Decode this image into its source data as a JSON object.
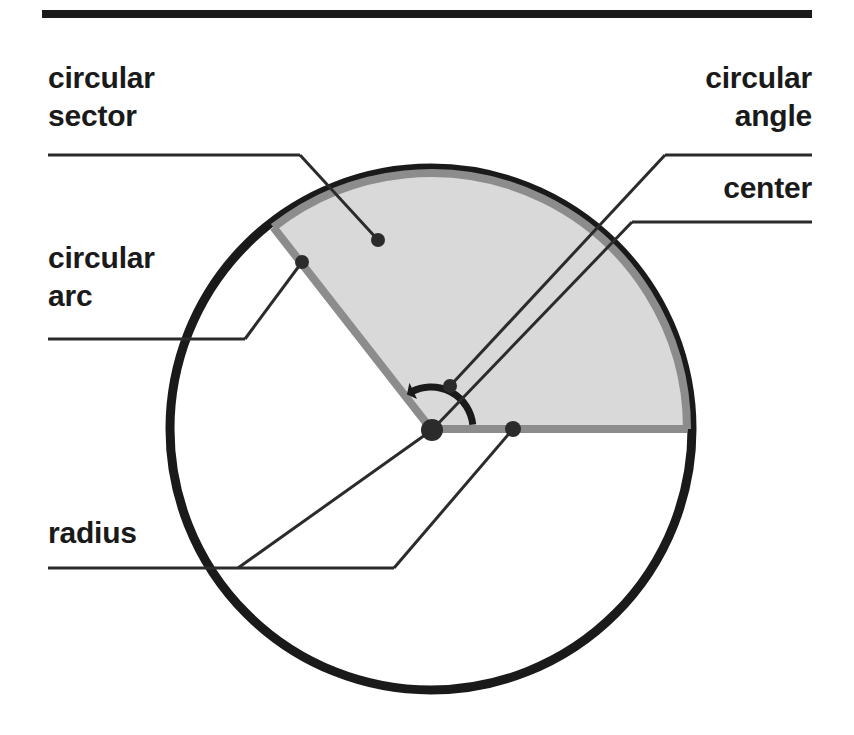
{
  "figure": {
    "background_color": "#ffffff",
    "rule_color": "#1a1a1a",
    "circle_stroke_color": "#1a1a1a",
    "sector_fill_color": "#d9d9d9",
    "sector_edge_color": "#8c8c8c",
    "leader_color": "#2b2b2b",
    "top_rule": {
      "x1": 42,
      "y1": 14,
      "x2": 812,
      "y2": 14,
      "thickness": 8
    }
  },
  "geometry": {
    "center": {
      "x": 431,
      "y": 429
    },
    "radius": 261,
    "sector_start_angle_deg": 0,
    "sector_end_angle_deg": 128,
    "angle_arc_radius": 42,
    "circle_stroke_width": 9,
    "sector_edge_width": 8
  },
  "labels": [
    {
      "id": "circular-sector",
      "text_lines": [
        "circular",
        "sector"
      ],
      "align": "left",
      "text_x": 48,
      "text_y": 88,
      "rule": {
        "x1": 48,
        "y1": 155,
        "x2": 300,
        "y2": 155
      },
      "leader": {
        "x1": 300,
        "y1": 155,
        "x2": 378,
        "y2": 240
      },
      "dot": {
        "x": 378,
        "y": 240,
        "r": 7
      }
    },
    {
      "id": "circular-arc",
      "text_lines": [
        "circular",
        "arc"
      ],
      "align": "left",
      "text_x": 48,
      "text_y": 268,
      "rule": {
        "x1": 48,
        "y1": 339,
        "x2": 245,
        "y2": 339
      },
      "leader": {
        "x1": 245,
        "y1": 339,
        "x2": 302,
        "y2": 262
      },
      "dot": {
        "x": 302,
        "y": 262,
        "r": 7
      }
    },
    {
      "id": "circular-angle",
      "text_lines": [
        "circular",
        "angle"
      ],
      "align": "right",
      "text_x": 812,
      "text_y": 88,
      "rule": {
        "x1": 812,
        "y1": 155,
        "x2": 665,
        "y2": 155
      },
      "leader": {
        "x1": 665,
        "y1": 155,
        "x2": 450,
        "y2": 386
      },
      "dot": {
        "x": 450,
        "y": 386,
        "r": 7
      }
    },
    {
      "id": "center",
      "text_lines": [
        "center"
      ],
      "align": "right",
      "text_x": 812,
      "text_y": 198,
      "rule": {
        "x1": 812,
        "y1": 222,
        "x2": 632,
        "y2": 222
      },
      "leader": {
        "x1": 632,
        "y1": 222,
        "x2": 432,
        "y2": 430
      },
      "dot": {
        "x": 432,
        "y": 430,
        "r": 11
      }
    },
    {
      "id": "radius",
      "text_lines": [
        "radius"
      ],
      "align": "left",
      "text_x": 48,
      "text_y": 543,
      "rule": {
        "x1": 48,
        "y1": 568,
        "x2": 394,
        "y2": 568
      },
      "leader": {
        "x1": 238,
        "y1": 568,
        "x2": 432,
        "y2": 430
      },
      "leader2": {
        "x1": 394,
        "y1": 568,
        "x2": 513,
        "y2": 429
      },
      "dot": {
        "x": 513,
        "y": 429,
        "r": 8
      }
    }
  ],
  "chart_data": {
    "type": "diagram",
    "annotations": [
      "circular sector",
      "circular arc",
      "circular angle",
      "center",
      "radius"
    ],
    "shape": "circle with highlighted sector",
    "sector_sweep_degrees": 128
  }
}
